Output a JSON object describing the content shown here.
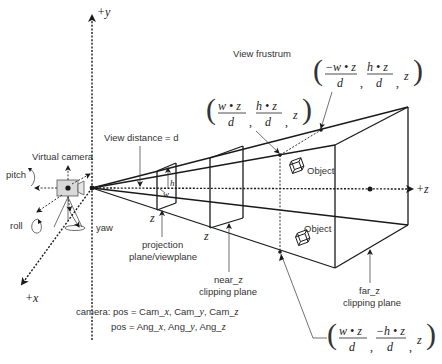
{
  "title": "View frustrum",
  "axes": {
    "y_label": "+y",
    "x_label": "+x",
    "z_label": "+z"
  },
  "camera": {
    "label": "Virtual camera",
    "rotations": {
      "pitch": "pitch",
      "roll": "roll",
      "yaw": "yaw"
    },
    "pos_line_prefix": "camera: pos = ",
    "pos_line": [
      "Cam_",
      "x",
      ", Cam_",
      "y",
      ", Cam_",
      "z"
    ],
    "ang_line_prefix": "pos = ",
    "ang_line": [
      "Ang_",
      "x",
      ", Ang_",
      "y",
      ", Ang_",
      "z"
    ]
  },
  "annotations": {
    "view_distance": "View distance = d",
    "projection_plane": [
      "projection",
      "plane/viewplane"
    ],
    "near_plane": [
      "near_z",
      "clipping plane"
    ],
    "near_plane_var": "z",
    "far_plane": [
      "far_z",
      "clipping plane"
    ],
    "far_plane_var": "z",
    "projection_z": "z",
    "near_z": "z",
    "h_label": "h",
    "w_label": "w",
    "object_top": "Object",
    "object_bottom": "Object"
  },
  "coordinates": [
    {
      "id": "top-left",
      "num1": "−w • z",
      "den1": "d",
      "num2": "h • z",
      "den2": "d",
      "third": "z"
    },
    {
      "id": "top-right",
      "num1": "w • z",
      "den1": "d",
      "num2": "h • z",
      "den2": "d",
      "third": "z"
    },
    {
      "id": "bottom-right",
      "num1": "w • z",
      "den1": "d",
      "num2": "−h • z",
      "den2": "d",
      "third": "z"
    }
  ],
  "colors": {
    "line": "#1a1a1a",
    "text": "#333333",
    "camera_body": "#d9d9d9"
  }
}
